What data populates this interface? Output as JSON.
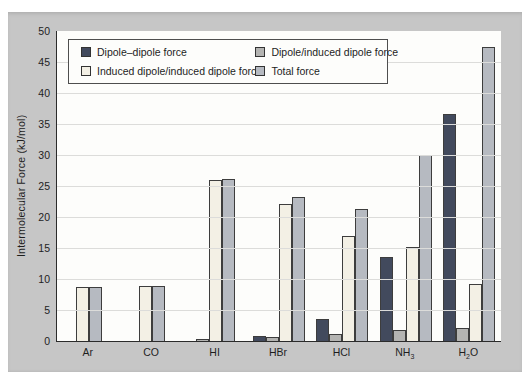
{
  "figure": {
    "background_color": "#c6c6c6",
    "plot_background_color": "#fdfdfb"
  },
  "chart_data": {
    "type": "bar",
    "title": "",
    "xlabel": "",
    "ylabel": "Intermolecular Force (kJ/mol)",
    "ylim": [
      0,
      50
    ],
    "ytick_step": 5,
    "grid": true,
    "legend_position": "top-left-inside",
    "categories": [
      "Ar",
      "CO",
      "HI",
      "HBr",
      "HCl",
      "NH3",
      "H2O"
    ],
    "categories_display": [
      {
        "pre": "Ar",
        "sub": "",
        "post": ""
      },
      {
        "pre": "CO",
        "sub": "",
        "post": ""
      },
      {
        "pre": "HI",
        "sub": "",
        "post": ""
      },
      {
        "pre": "HBr",
        "sub": "",
        "post": ""
      },
      {
        "pre": "HCl",
        "sub": "",
        "post": ""
      },
      {
        "pre": "NH",
        "sub": "3",
        "post": ""
      },
      {
        "pre": "H",
        "sub": "2",
        "post": "O"
      }
    ],
    "series": [
      {
        "name": "Dipole–dipole force",
        "color": "#424a5d",
        "values": [
          0,
          0,
          0.025,
          0.69,
          3.31,
          13.31,
          36.38
        ]
      },
      {
        "name": "Dipole/induced dipole force",
        "color": "#b4b4b2",
        "values": [
          0,
          0,
          0.113,
          0.5,
          1.0,
          1.55,
          1.93
        ]
      },
      {
        "name": "Induced dipole/induced dipole force",
        "color": "#f3f0e5",
        "values": [
          8.5,
          8.75,
          25.87,
          21.94,
          16.83,
          14.94,
          9.0
        ]
      },
      {
        "name": "Total force",
        "color": "#b6bac1",
        "values": [
          8.5,
          8.75,
          26.0,
          23.11,
          21.14,
          29.8,
          47.31
        ]
      }
    ],
    "colors": {
      "axis": "#2b2b2b",
      "gridline": "#dcdcda",
      "bar_border": "#3d3d3d",
      "text": "#1e1e1e"
    }
  }
}
